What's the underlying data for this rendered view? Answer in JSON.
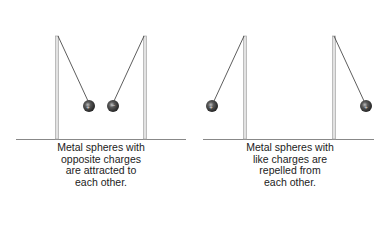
{
  "panels": [
    {
      "id": "attract",
      "caption_lines": [
        "Metal spheres with",
        "opposite charges",
        "are attracted to",
        "each other."
      ],
      "baseline": {
        "x1": 16,
        "x2": 186,
        "y": 139
      },
      "poles": [
        {
          "x": 57,
          "top": 36
        },
        {
          "x": 145,
          "top": 36
        }
      ],
      "spheres": [
        {
          "anchor_x": 58,
          "anchor_y": 36,
          "cx": 89,
          "cy": 106
        },
        {
          "anchor_x": 144,
          "anchor_y": 36,
          "cx": 113,
          "cy": 106
        }
      ]
    },
    {
      "id": "repel",
      "caption_lines": [
        "Metal spheres with",
        "like charges are",
        "repelled from",
        "each other."
      ],
      "baseline": {
        "x1": 203,
        "x2": 374,
        "y": 139
      },
      "poles": [
        {
          "x": 245,
          "top": 36
        },
        {
          "x": 334,
          "top": 36
        }
      ],
      "spheres": [
        {
          "anchor_x": 244,
          "anchor_y": 36,
          "cx": 212,
          "cy": 106
        },
        {
          "anchor_x": 334,
          "anchor_y": 36,
          "cx": 366,
          "cy": 106
        }
      ]
    }
  ],
  "colors": {
    "pole": "#cfcfcf",
    "pole_edge": "#9a9a9a",
    "string": "#333333",
    "sphere_dark": "#2a2a2a",
    "sphere_light": "#8a8a8a",
    "baseline": "#888888"
  }
}
